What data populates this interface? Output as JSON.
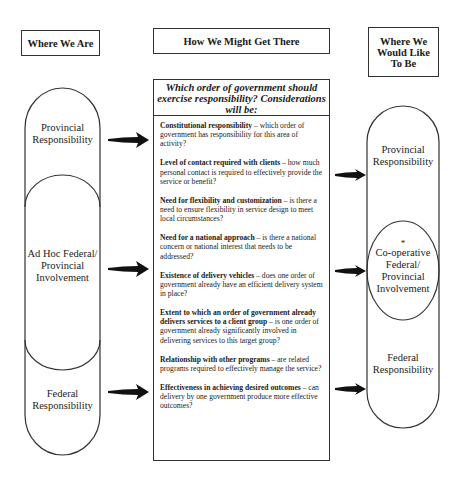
{
  "headers": {
    "left": "Where We Are",
    "middle": "How We Might Get There",
    "right": "Where We Would Like To Be"
  },
  "left_column": {
    "segments": [
      {
        "label": "Provincial Responsibility"
      },
      {
        "label": "Ad Hoc Federal/ Provincial Involvement"
      },
      {
        "label": "Federal Responsibility"
      }
    ]
  },
  "middle_column": {
    "question": "Which order of government should exercise responsibility? Considerations will be:",
    "considerations": [
      {
        "title": "Constitutional responsibility",
        "text": " – which order of government has responsibility for this area of activity?"
      },
      {
        "title": "Level of contact required with clients",
        "text": " – how much personal contact is required to effectively provide the service or benefit?"
      },
      {
        "title": "Need for flexibility and customization",
        "text": " – is there a need to ensure flexibility in service design to meet local circumstances?"
      },
      {
        "title": "Need for a national approach",
        "text": " – is there a national concern or national interest that needs to be addressed?"
      },
      {
        "title": "Existence of delivery vehicles",
        "text": " – does one order of government already have an efficient delivery system in place?"
      },
      {
        "title": "Extent to which an order of government already delivers services to a client group",
        "text": " – is one order of government already significantly involved in delivering services to this target group?"
      },
      {
        "title": "Relationship with other programs",
        "text": " – are related programs required to effectively manage the service?"
      },
      {
        "title": "Effectiveness in achieving desired outcomes",
        "text": " – can delivery by one government produce more effective outcomes?"
      }
    ]
  },
  "right_column": {
    "segments": [
      {
        "label": "Provincial Responsibility"
      },
      {
        "marker": "*",
        "label": "Co-operative Federal/ Provincial Involvement"
      },
      {
        "label": "Federal Responsibility"
      }
    ]
  }
}
